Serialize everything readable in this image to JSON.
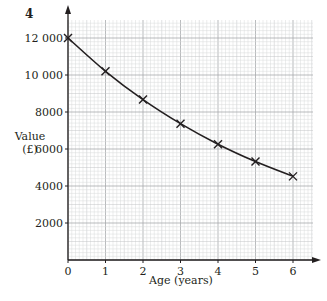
{
  "question_number": "4",
  "chart_data": {
    "type": "line",
    "title": "",
    "xlabel": "Age (years)",
    "ylabel": "Value (£)",
    "ylabel_lines": [
      "Value",
      "(£)"
    ],
    "x": [
      0,
      1,
      2,
      3,
      4,
      5,
      6
    ],
    "series": [
      {
        "name": "Value",
        "marker": "x",
        "values": [
          12000,
          10200,
          8670,
          7370,
          6260,
          5320,
          4520
        ]
      }
    ],
    "x_ticks": [
      0,
      1,
      2,
      3,
      4,
      5,
      6
    ],
    "x_tick_labels": [
      "0",
      "1",
      "2",
      "3",
      "4",
      "5",
      "6"
    ],
    "y_ticks": [
      2000,
      4000,
      6000,
      8000,
      10000,
      12000
    ],
    "y_tick_labels": [
      "2000",
      "4000",
      "6000",
      "8000",
      "10 000",
      "12 000"
    ],
    "xlim": [
      0,
      6.5
    ],
    "ylim": [
      0,
      13000
    ],
    "grid": true,
    "grid_minor_per_unit": 10,
    "legend": null
  },
  "colors": {
    "ink": "#231f20",
    "grid_major": "#a7a9ac",
    "grid_minor": "#d9dadb"
  }
}
